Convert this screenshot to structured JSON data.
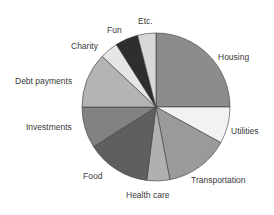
{
  "chart_data": {
    "type": "pie",
    "title": "",
    "start_angle_deg": 0,
    "direction": "clockwise",
    "slices": [
      {
        "label": "Housing",
        "value": 25,
        "color": "#8c8c8c"
      },
      {
        "label": "Utilities",
        "value": 8,
        "color": "#f2f2f2"
      },
      {
        "label": "Transportation",
        "value": 14,
        "color": "#9a9a9a"
      },
      {
        "label": "Health care",
        "value": 5,
        "color": "#b0b0b0"
      },
      {
        "label": "Food",
        "value": 14,
        "color": "#5f5f5f"
      },
      {
        "label": "Investments",
        "value": 9,
        "color": "#828282"
      },
      {
        "label": "Debt payments",
        "value": 12,
        "color": "#b4b4b4"
      },
      {
        "label": "Charity",
        "value": 4,
        "color": "#e6e6e6"
      },
      {
        "label": "Fun",
        "value": 5,
        "color": "#2e2e2e"
      },
      {
        "label": "Etc.",
        "value": 4,
        "color": "#d8d8d8"
      }
    ],
    "legend": "none (direct labels)"
  },
  "labels": {
    "housing": "Housing",
    "utilities": "Utilities",
    "transportation": "Transportation",
    "health_care": "Health care",
    "food": "Food",
    "investments": "Investments",
    "debt_payments": "Debt payments",
    "charity": "Charity",
    "fun": "Fun",
    "etc": "Etc."
  }
}
